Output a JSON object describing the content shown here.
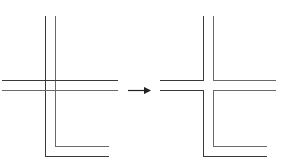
{
  "diagram": {
    "stroke_color": "#3a3a3a",
    "secondary_stroke_color": "#6a6a6a",
    "before": {
      "label": "",
      "vertical_lines_x": [
        45,
        55
      ],
      "horizontal_lines_y": [
        80,
        90
      ],
      "corner_bottom_y": [
        156,
        146
      ],
      "corner_right_x": 109
    },
    "arrow": {
      "direction": "right",
      "x1": 128,
      "x2": 150,
      "y": 90
    },
    "after": {
      "label": "",
      "vertical_lines_x": [
        203,
        213
      ],
      "horizontal_lines_y": [
        80,
        90
      ],
      "corner_bottom_y": [
        156,
        146
      ],
      "corner_right_x": 267
    }
  }
}
